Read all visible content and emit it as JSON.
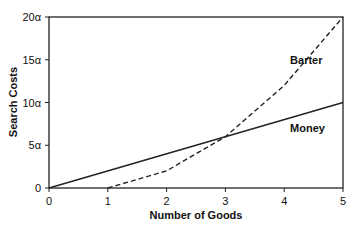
{
  "chart_data": {
    "type": "line",
    "title": "",
    "xlabel": "Number of Goods",
    "ylabel": "Search Costs",
    "xlim": [
      0,
      5
    ],
    "ylim": [
      0,
      20
    ],
    "x_ticks": [
      "0",
      "1",
      "2",
      "3",
      "4",
      "5"
    ],
    "y_ticks": [
      "0",
      "5α",
      "10α",
      "15α",
      "20α"
    ],
    "grid": false,
    "series": [
      {
        "name": "Barter",
        "style": "dashed",
        "x": [
          1,
          2,
          3,
          4,
          5
        ],
        "values": [
          0,
          2,
          6,
          12,
          20
        ]
      },
      {
        "name": "Money",
        "style": "solid",
        "x": [
          0,
          5
        ],
        "values": [
          0,
          10
        ]
      }
    ],
    "annotations": [
      {
        "text": "Barter",
        "x": 4.1,
        "y": 14.5
      },
      {
        "text": "Money",
        "x": 4.1,
        "y": 6.5
      }
    ]
  }
}
